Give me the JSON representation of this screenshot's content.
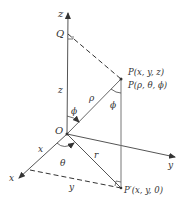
{
  "diagram": {
    "colors": {
      "line": "#555555",
      "dashed": "#333333",
      "text": "#333333",
      "point": "#333333"
    },
    "axes": {
      "x": "x",
      "y": "y",
      "z": "z"
    },
    "points": {
      "origin": "O",
      "q": "Q",
      "p_cartesian": "P(x, y, z)",
      "p_spherical": "P(ρ, θ, ϕ)",
      "p_prime": "P′(x, y, 0)"
    },
    "labels": {
      "z_segment": "z",
      "rho": "ρ",
      "phi_at_p": "ϕ",
      "phi_at_o": "ϕ",
      "theta": "θ",
      "x_segment": "x",
      "r": "r",
      "y_segment": "y"
    }
  }
}
